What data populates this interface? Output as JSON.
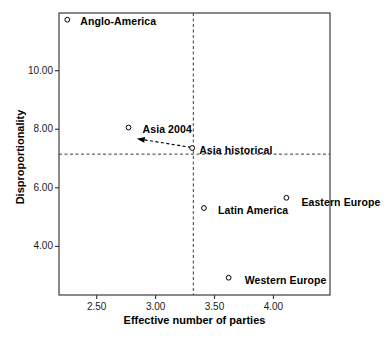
{
  "figure": {
    "background": "#ffffff",
    "text_color": "#000000",
    "line_color": "#3d3d3d",
    "marker_fill": "#ffffff",
    "marker_stroke": "#000000"
  },
  "chart_data": {
    "type": "scatter",
    "title": "",
    "xlabel": "Effective number of parties",
    "ylabel": "Disproportionality",
    "xlim": [
      2.18,
      4.48
    ],
    "ylim": [
      2.34,
      11.97
    ],
    "grid": false,
    "legend": null,
    "x_ticks": [
      {
        "value": 2.5,
        "label": "2.50"
      },
      {
        "value": 3.0,
        "label": "3.00"
      },
      {
        "value": 3.5,
        "label": "3.50"
      },
      {
        "value": 4.0,
        "label": "4.00"
      }
    ],
    "y_ticks": [
      {
        "value": 4.0,
        "label": "4.00"
      },
      {
        "value": 6.0,
        "label": "6.00"
      },
      {
        "value": 8.0,
        "label": "8.00"
      },
      {
        "value": 10.0,
        "label": "10.00"
      }
    ],
    "reference_lines": [
      {
        "orientation": "vertical",
        "value": 3.32,
        "style": "dashed"
      },
      {
        "orientation": "horizontal",
        "value": 7.15,
        "style": "dashed"
      }
    ],
    "points": [
      {
        "label": "Anglo-America",
        "x": 2.25,
        "y": 11.74,
        "label_dx": 13,
        "label_dy": 1
      },
      {
        "label": "Asia 2004",
        "x": 2.77,
        "y": 8.06,
        "label_dx": 14,
        "label_dy": 2
      },
      {
        "label": "Asia historical",
        "x": 3.31,
        "y": 7.36,
        "label_dx": 7,
        "label_dy": 2
      },
      {
        "label": "Latin America",
        "x": 3.41,
        "y": 5.31,
        "label_dx": 14,
        "label_dy": 2
      },
      {
        "label": "Eastern Europe",
        "x": 4.11,
        "y": 5.66,
        "label_dx": 15,
        "label_dy": 4
      },
      {
        "label": "Western Europe",
        "x": 3.62,
        "y": 2.93,
        "label_dx": 16,
        "label_dy": 2
      }
    ],
    "arrow": {
      "from_x": 3.3,
      "from_y": 7.38,
      "to_x": 2.84,
      "to_y": 7.68,
      "style": "dashed",
      "meaning": "shift from Asia historical toward Asia 2004"
    }
  }
}
